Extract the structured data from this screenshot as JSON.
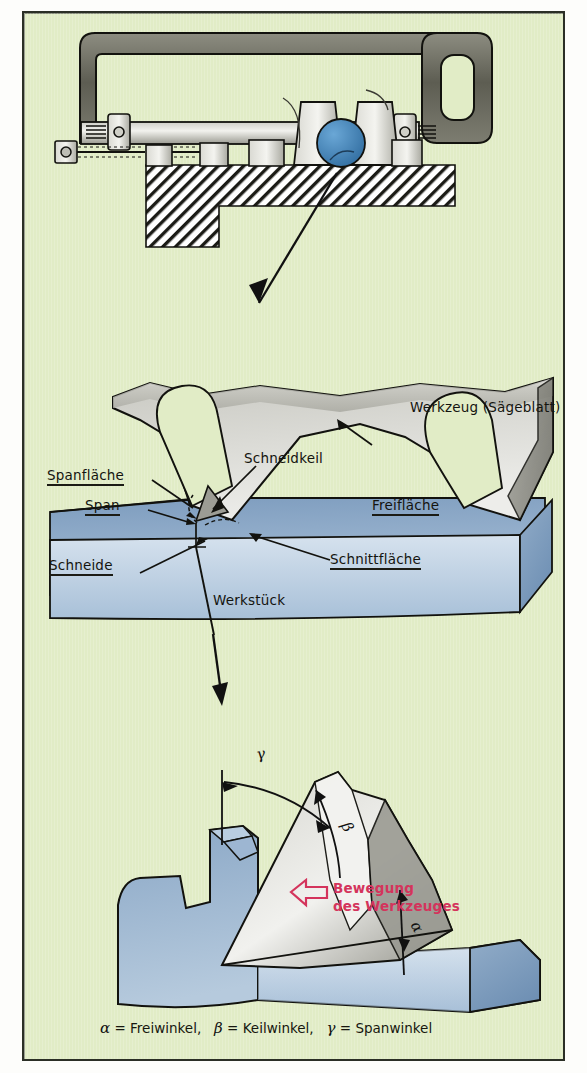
{
  "figure": {
    "background_color": "#e1ecc6",
    "frame_color": "#2b2f26",
    "title_implicit": "Spanabnahme beim Sägen"
  },
  "palette": {
    "background_green": "#e1ecc6",
    "tool_grey_light": "#efefea",
    "tool_grey_mid": "#b9b9b2",
    "tool_grey_dark": "#8e8e86",
    "workpiece_blue": "#8ea9c8",
    "workpiece_blue_light": "#cfdcea",
    "saw_frame_dark": "#6f6f63",
    "round_stock_blue": "#3f7fb5",
    "outline": "#141410",
    "annotation_red": "#d4345c"
  },
  "panels": {
    "top": {
      "name": "Bügelsäge im Schraubstock",
      "parts": {
        "saw_frame": "Sägebügel",
        "saw_blade": "Sägeblatt",
        "handle": "Handgriff",
        "vise": "Schraubstock",
        "round_stock": "Rundmaterial",
        "bench": "Werkbank"
      }
    },
    "middle": {
      "name": "Schneidvorgang vergrößert",
      "labels": [
        {
          "text": "Werkzeug (Sägeblatt)",
          "underline": false
        },
        {
          "text": "Spanfläche",
          "underline": true
        },
        {
          "text": "Span",
          "underline": true
        },
        {
          "text": "Schneidkeil",
          "underline": false
        },
        {
          "text": "Freifläche",
          "underline": true
        },
        {
          "text": "Schneide",
          "underline": true
        },
        {
          "text": "Schnittfläche",
          "underline": true
        },
        {
          "text": "Werkstück",
          "underline": false
        }
      ]
    },
    "bottom": {
      "name": "Keilwinkel am Sägezahn",
      "motion_label_line1": "Bewegung",
      "motion_label_line2": "des Werkzeuges",
      "angle_markers": [
        {
          "symbol": "γ",
          "meaning": "Spanwinkel"
        },
        {
          "symbol": "β",
          "meaning": "Keilwinkel"
        },
        {
          "symbol": "α",
          "meaning": "Freiwinkel"
        }
      ]
    }
  },
  "caption": {
    "full": "α = Freiwinkel,  β = Keilwinkel,  γ = Spanwinkel",
    "items": [
      {
        "symbol": "α",
        "sep": "=",
        "term": "Freiwinkel,"
      },
      {
        "symbol": "β",
        "sep": "=",
        "term": "Keilwinkel,"
      },
      {
        "symbol": "γ",
        "sep": "=",
        "term": "Spanwinkel"
      }
    ]
  },
  "connectors": [
    {
      "name": "zoom-arrow-top",
      "from_panel": "top",
      "to_panel": "middle"
    },
    {
      "name": "zoom-arrow-middle",
      "from_panel": "middle",
      "to_panel": "bottom"
    }
  ]
}
